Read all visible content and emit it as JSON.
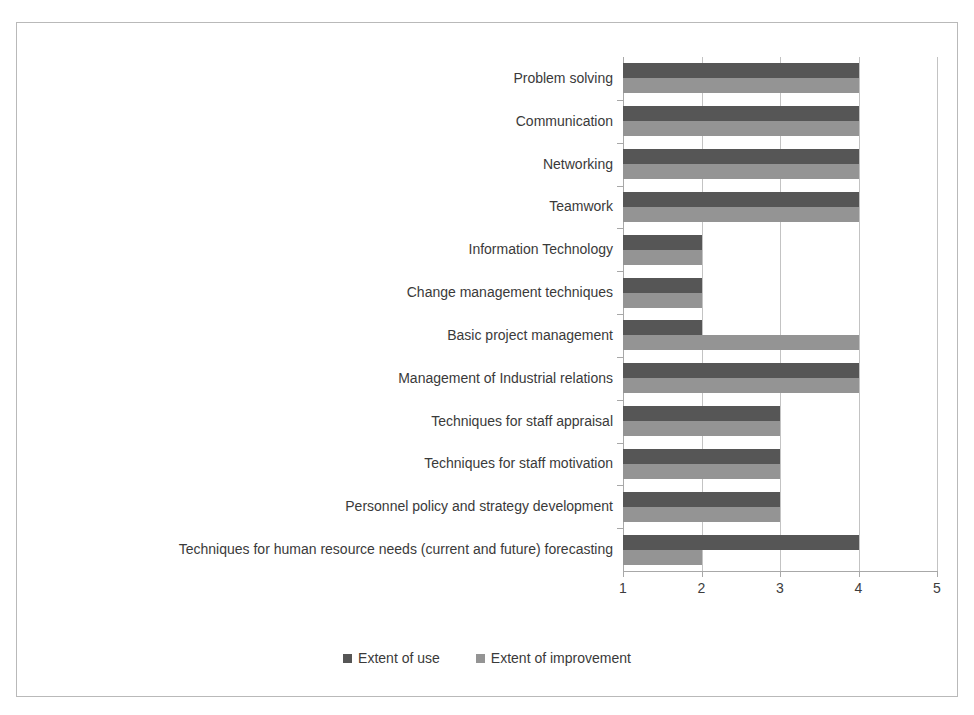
{
  "chart_data": {
    "type": "bar",
    "orientation": "horizontal",
    "title": "",
    "subtitle": "",
    "xlabel": "",
    "ylabel": "",
    "xlim": [
      1,
      5
    ],
    "xticks": [
      "1",
      "2",
      "3",
      "4",
      "5"
    ],
    "grid": true,
    "legend_position": "bottom",
    "categories": [
      "Problem solving",
      "Communication",
      "Networking",
      "Teamwork",
      "Information Technology",
      "Change management techniques",
      "Basic project management",
      "Management of Industrial relations",
      "Techniques for staff appraisal",
      "Techniques for staff motivation",
      "Personnel policy and strategy development",
      "Techniques for human resource needs (current and future) forecasting"
    ],
    "series": [
      {
        "name": "Extent of use",
        "color": "#565656",
        "values": [
          4,
          4,
          4,
          4,
          2,
          2,
          2,
          4,
          3,
          3,
          3,
          4
        ]
      },
      {
        "name": "Extent of improvement",
        "color": "#949494",
        "values": [
          4,
          4,
          4,
          4,
          2,
          2,
          4,
          4,
          3,
          3,
          3,
          2
        ]
      }
    ]
  },
  "legend": {
    "entries": [
      {
        "label": "Extent of use"
      },
      {
        "label": "Extent of improvement"
      }
    ]
  },
  "axis": {
    "x": {
      "ticks": [
        "1",
        "2",
        "3",
        "4",
        "5"
      ]
    }
  },
  "colors": {
    "series_use": "#565656",
    "series_improvement": "#949494",
    "gridline": "#c3c3c3",
    "axis": "#a8a8a8",
    "frame_border": "#b9b9b9",
    "text": "#3a3a3a",
    "background": "#ffffff"
  }
}
